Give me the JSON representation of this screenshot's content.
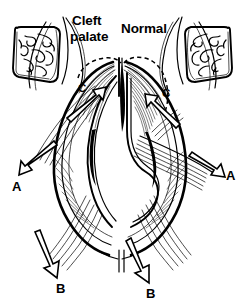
{
  "figure": {
    "kind": "medical-line-illustration",
    "background_color": "#ffffff",
    "ink_color": "#000000",
    "width": 245,
    "height": 306
  },
  "titles": {
    "left_line1": "Cleft",
    "left_line2": "palate",
    "right": "Normal"
  },
  "insets": {
    "left": {
      "name": "cleft-palate-oral-view",
      "description": "Intraoral view of palate with cleft"
    },
    "right": {
      "name": "normal-palate-oral-view",
      "description": "Intraoral view of normal palate"
    }
  },
  "arrow_labels": {
    "a_left": "A",
    "a_right": "A",
    "b_left": "B",
    "b_right": "B",
    "c_left": "C",
    "c_right": "C"
  },
  "arrow_meanings": {
    "A": "Lateral muscle pull vector",
    "B": "Inferior / posterior muscle pull vector",
    "C": "Superomedial levator veli palatini vector"
  },
  "caption": {
    "cut_off_line": ""
  }
}
